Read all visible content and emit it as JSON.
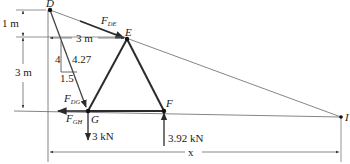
{
  "figure": {
    "nodes": {
      "D": {
        "label": "D",
        "x": 50,
        "y": 10
      },
      "E": {
        "label": "E",
        "x": 127,
        "y": 39
      },
      "G": {
        "label": "G",
        "x": 88,
        "y": 111
      },
      "F": {
        "label": "F",
        "x": 164,
        "y": 111
      },
      "I": {
        "label": "I",
        "x": 341,
        "y": 117
      }
    },
    "forces": {
      "FDE": {
        "main": "F",
        "sub": "DE"
      },
      "FDG": {
        "main": "F",
        "sub": "DG"
      },
      "FGH": {
        "main": "F",
        "sub": "GH"
      },
      "load_G": "3 kN",
      "reaction_F": "3.92 kN"
    },
    "dimensions": {
      "vertical_top": "1 m",
      "vertical_bottom": "3 m",
      "horizontal_DE": "3 m",
      "span_x": "x"
    },
    "slope_triangle": {
      "rise": "4",
      "hypotenuse": "4.27",
      "run": "1.5"
    },
    "colors": {
      "member": "#2b2b2b",
      "line": "#555555",
      "text": "#1a1a1a"
    }
  }
}
